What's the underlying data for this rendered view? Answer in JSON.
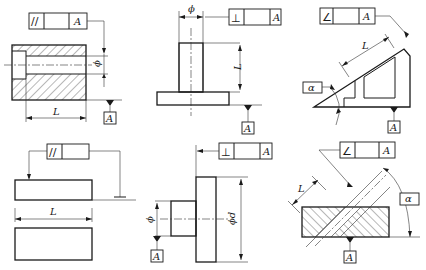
{
  "figures": [
    {
      "id": "fig1",
      "description": "Parallelism of hole axis to datum A",
      "frame": {
        "symbol": "//",
        "tolerance": "",
        "datum": "A"
      },
      "labels": {
        "length": "L",
        "diameter": "ϕ",
        "datum": "A"
      }
    },
    {
      "id": "fig2",
      "description": "Perpendicularity of shaft axis to datum plane A",
      "frame": {
        "symbol": "⊥",
        "tolerance": "",
        "datum": "A"
      },
      "labels": {
        "length": "L",
        "diameter": "ϕ",
        "datum": "A"
      }
    },
    {
      "id": "fig3",
      "description": "Angularity of inclined surface to datum A",
      "frame": {
        "symbol": "∠",
        "tolerance": "",
        "datum": "A"
      },
      "labels": {
        "length": "L",
        "angle": "α",
        "datum": "A"
      }
    },
    {
      "id": "fig4",
      "description": "Parallelism of surface with measuring length",
      "frame": {
        "symbol": "//",
        "tolerance": ""
      },
      "labels": {
        "length": "L"
      }
    },
    {
      "id": "fig5",
      "description": "Perpendicularity of flange face to datum axis A",
      "frame": {
        "symbol": "⊥",
        "tolerance": "",
        "datum": "A"
      },
      "labels": {
        "diameter": "ϕ",
        "big_diameter": "ϕd",
        "datum": "A"
      }
    },
    {
      "id": "fig6",
      "description": "Angularity of inclined hole axis to datum A",
      "frame": {
        "symbol": "∠",
        "tolerance": "",
        "datum": "A"
      },
      "labels": {
        "length": "L",
        "angle": "α",
        "datum": "A"
      }
    }
  ]
}
